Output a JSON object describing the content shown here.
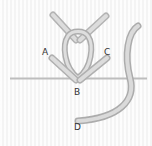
{
  "diagram": {
    "type": "embroidery stitch illustration",
    "labels": [
      {
        "id": "A",
        "text": "A",
        "x": 42,
        "y": 48
      },
      {
        "id": "B",
        "text": "B",
        "x": 74,
        "y": 88
      },
      {
        "id": "C",
        "text": "C",
        "x": 104,
        "y": 48
      },
      {
        "id": "D",
        "text": "D",
        "x": 74,
        "y": 123
      }
    ],
    "colors": {
      "thread": "#c8c8c8",
      "thread_highlight": "#e6e6e6",
      "thread_shadow": "#a9a9a9",
      "baseline": "#bdbdbd",
      "background": "#f8f8f8",
      "label": "#333333"
    }
  }
}
